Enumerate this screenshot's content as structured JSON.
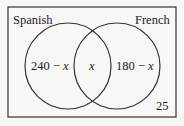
{
  "diagram": {
    "type": "venn",
    "universe_total_outside": "25",
    "sets": [
      {
        "name": "Spanish",
        "only_region": "240 − x"
      },
      {
        "name": "French",
        "only_region": "180 − x"
      }
    ],
    "intersection": "x",
    "labels": {
      "spanish": "Spanish",
      "french": "French",
      "spanish_only_num": "240 − ",
      "spanish_only_var": "x",
      "both": "x",
      "french_only_num": "180 − ",
      "french_only_var": "x",
      "outside": "25"
    },
    "colors": {
      "stroke": "#333333",
      "background": "#f7f7f5",
      "text": "#222222"
    }
  }
}
